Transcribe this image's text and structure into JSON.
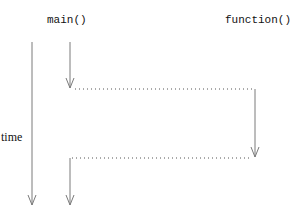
{
  "diagram": {
    "labels": {
      "caller": "main()",
      "callee": "function()",
      "axis": "time"
    },
    "colors": {
      "line": "#7a7a7a",
      "dotted": "#555555",
      "text": "#111111",
      "background": "#ffffff"
    },
    "elements": [
      {
        "type": "arrow",
        "name": "time-axis",
        "from": [
          32,
          42
        ],
        "to": [
          32,
          205
        ]
      },
      {
        "type": "arrow",
        "name": "main-execution-before",
        "from": [
          70,
          42
        ],
        "to": [
          70,
          88
        ]
      },
      {
        "type": "dotted",
        "name": "call-line",
        "from": [
          75,
          89
        ],
        "to": [
          255,
          89
        ]
      },
      {
        "type": "arrow",
        "name": "function-execution",
        "from": [
          255,
          89
        ],
        "to": [
          255,
          157
        ]
      },
      {
        "type": "dotted",
        "name": "return-line",
        "from": [
          70,
          158
        ],
        "to": [
          252,
          158
        ]
      },
      {
        "type": "arrow",
        "name": "main-execution-after",
        "from": [
          70,
          158
        ],
        "to": [
          70,
          205
        ]
      }
    ]
  }
}
